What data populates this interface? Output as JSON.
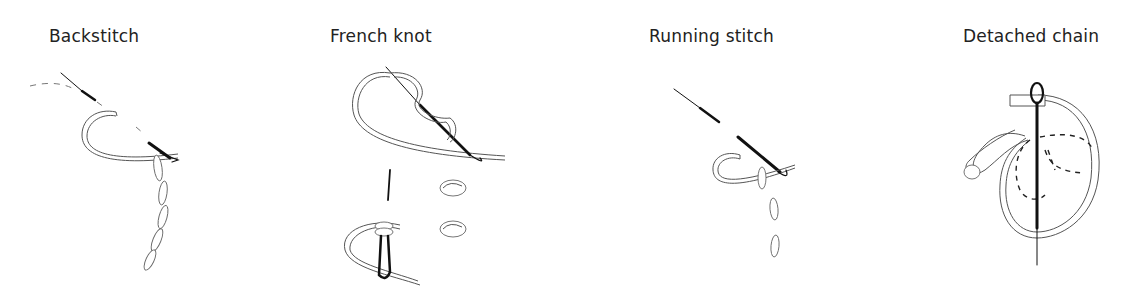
{
  "panels": [
    {
      "id": "backstitch",
      "label": "Backstitch",
      "illustration": "needle-backstitch-icon"
    },
    {
      "id": "french-knot",
      "label": "French knot",
      "illustration": "needle-french-knot-icon"
    },
    {
      "id": "running-stitch",
      "label": "Running stitch",
      "illustration": "needle-running-stitch-icon"
    },
    {
      "id": "detached-chain",
      "label": "Detached chain",
      "illustration": "needle-detached-chain-icon"
    }
  ],
  "colors": {
    "background": "#ffffff",
    "text": "#222222",
    "line": "#555555",
    "needle": "#111111"
  }
}
